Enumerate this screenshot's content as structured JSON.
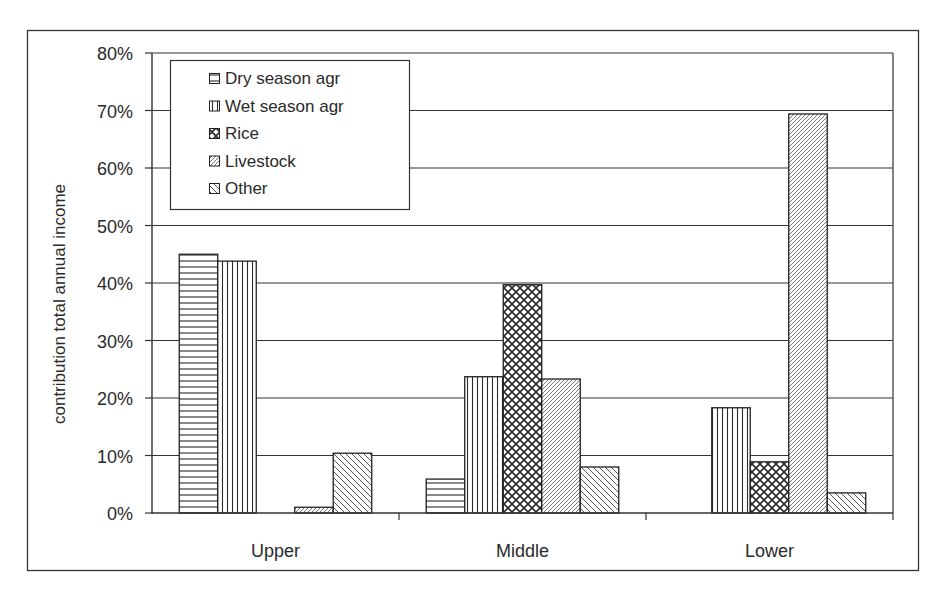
{
  "chart_data": {
    "type": "bar",
    "title": "",
    "xlabel": "",
    "ylabel": "contribution total annual income",
    "ylim": [
      0,
      0.8
    ],
    "yticks": [
      "0%",
      "10%",
      "20%",
      "30%",
      "40%",
      "50%",
      "60%",
      "70%",
      "80%"
    ],
    "grid": true,
    "legend_position": "upper-left-inside",
    "categories": [
      "Upper",
      "Middle",
      "Lower"
    ],
    "series": [
      {
        "name": "Dry season agr",
        "pattern": "horizontal-lines",
        "values": [
          0.45,
          0.059,
          0.0
        ]
      },
      {
        "name": "Wet season agr",
        "pattern": "vertical-lines",
        "values": [
          0.438,
          0.237,
          0.183
        ]
      },
      {
        "name": "Rice",
        "pattern": "diagonal-cross",
        "values": [
          0.0,
          0.397,
          0.089
        ]
      },
      {
        "name": "Livestock",
        "pattern": "fine-forward-diagonal",
        "values": [
          0.01,
          0.233,
          0.694
        ]
      },
      {
        "name": "Other",
        "pattern": "backward-diagonal",
        "values": [
          0.104,
          0.08,
          0.035
        ]
      }
    ]
  },
  "legend": {
    "items": [
      {
        "label": "Dry season agr",
        "icon": "horizontal-hatch-swatch"
      },
      {
        "label": "Wet season agr",
        "icon": "vertical-hatch-swatch"
      },
      {
        "label": "Rice",
        "icon": "crosshatch-swatch"
      },
      {
        "label": "Livestock",
        "icon": "forward-diagonal-swatch"
      },
      {
        "label": "Other",
        "icon": "backward-diagonal-swatch"
      }
    ]
  },
  "colors": {
    "ink": "#2a2a2a",
    "background": "#ffffff"
  }
}
